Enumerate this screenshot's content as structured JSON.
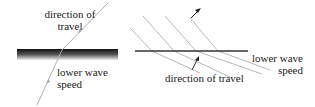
{
  "left_panel": {
    "label_top_line1": "direction of",
    "label_top_line2": "travel",
    "label_bottom_line1": "lower wave",
    "label_bottom_line2": "speed"
  },
  "right_panel": {
    "label_right_line1": "lower wave",
    "label_right_line2": "speed",
    "label_bottom": "direction of travel"
  },
  "colors": {
    "ray": "#b0b0b0",
    "boundary": "#333333",
    "text": "#222222"
  }
}
